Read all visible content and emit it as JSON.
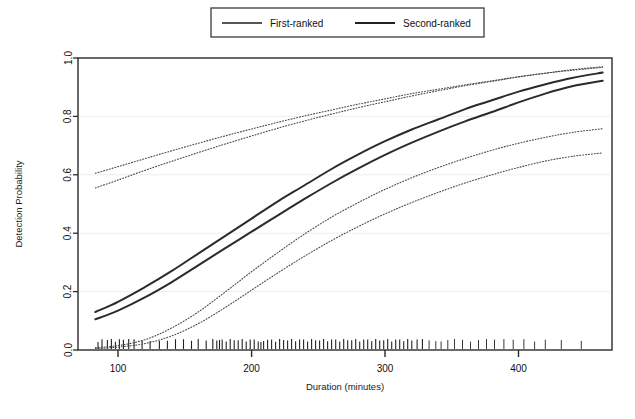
{
  "chart_data": {
    "type": "line",
    "title": "",
    "xlabel": "Duration (minutes)",
    "ylabel": "Detection Probability",
    "xlim": [
      70,
      470
    ],
    "ylim": [
      0.0,
      1.0
    ],
    "xticks": [
      100,
      200,
      300,
      400
    ],
    "xtick_labels": [
      "100",
      "200",
      "300",
      "400"
    ],
    "yticks": [
      0.0,
      0.2,
      0.4,
      0.6,
      0.8,
      1.0
    ],
    "ytick_labels": [
      "0.0",
      "0.2",
      "0.4",
      "0.6",
      "0.8",
      "1.0"
    ],
    "grid": false,
    "legend_position": "top-center",
    "legend_entries": [
      "First-ranked",
      "Second-ranked"
    ],
    "line_color": "#2b2b2b",
    "band_color": "#4a4a4a",
    "x": [
      83,
      100,
      120,
      140,
      160,
      180,
      200,
      220,
      240,
      260,
      280,
      300,
      320,
      340,
      360,
      380,
      400,
      420,
      440,
      463
    ],
    "series": [
      {
        "name": "First-ranked",
        "style": "solid",
        "values": [
          0.13,
          0.165,
          0.215,
          0.27,
          0.33,
          0.39,
          0.45,
          0.51,
          0.565,
          0.62,
          0.67,
          0.715,
          0.755,
          0.79,
          0.825,
          0.855,
          0.885,
          0.91,
          0.932,
          0.95
        ]
      },
      {
        "name": "Second-ranked",
        "style": "solid",
        "values": [
          0.105,
          0.135,
          0.18,
          0.232,
          0.29,
          0.348,
          0.405,
          0.462,
          0.518,
          0.572,
          0.622,
          0.668,
          0.71,
          0.748,
          0.783,
          0.815,
          0.848,
          0.878,
          0.903,
          0.922
        ]
      },
      {
        "name": "First-ranked upper band",
        "style": "dotted",
        "values": [
          0.605,
          0.628,
          0.655,
          0.682,
          0.708,
          0.733,
          0.757,
          0.78,
          0.802,
          0.822,
          0.842,
          0.86,
          0.878,
          0.893,
          0.908,
          0.922,
          0.936,
          0.948,
          0.958,
          0.968
        ]
      },
      {
        "name": "Second-ranked upper band",
        "style": "dotted",
        "values": [
          0.555,
          0.582,
          0.615,
          0.646,
          0.676,
          0.705,
          0.733,
          0.76,
          0.785,
          0.808,
          0.83,
          0.85,
          0.87,
          0.888,
          0.905,
          0.92,
          0.935,
          0.948,
          0.96,
          0.97
        ]
      },
      {
        "name": "First-ranked lower band",
        "style": "dotted",
        "values": [
          0.008,
          0.015,
          0.035,
          0.075,
          0.13,
          0.198,
          0.268,
          0.335,
          0.398,
          0.455,
          0.505,
          0.55,
          0.59,
          0.625,
          0.656,
          0.684,
          0.708,
          0.728,
          0.745,
          0.758
        ]
      },
      {
        "name": "Second-ranked lower band",
        "style": "dotted",
        "values": [
          0.005,
          0.01,
          0.022,
          0.048,
          0.09,
          0.145,
          0.205,
          0.265,
          0.322,
          0.375,
          0.423,
          0.466,
          0.505,
          0.54,
          0.572,
          0.6,
          0.625,
          0.647,
          0.663,
          0.675
        ]
      }
    ],
    "rug_plot": {
      "label": "data-observations-rug",
      "values": [
        85,
        88,
        92,
        95,
        98,
        101,
        104,
        108,
        112,
        118,
        124,
        131,
        137,
        143,
        149,
        155,
        160,
        166,
        171,
        174,
        176,
        178,
        181,
        184,
        187,
        190,
        193,
        196,
        199,
        202,
        205,
        207,
        209,
        212,
        215,
        218,
        221,
        224,
        227,
        230,
        233,
        236,
        239,
        242,
        245,
        248,
        251,
        254,
        257,
        260,
        263,
        266,
        269,
        272,
        275,
        278,
        281,
        284,
        287,
        290,
        293,
        296,
        299,
        302,
        305,
        308,
        311,
        314,
        317,
        320,
        324,
        328,
        333,
        338,
        342,
        347,
        352,
        358,
        364,
        370,
        376,
        382,
        389,
        396,
        404,
        412,
        420,
        432,
        447
      ]
    }
  }
}
